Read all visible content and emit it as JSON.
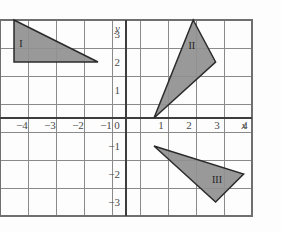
{
  "chart_data": {
    "type": "scatter",
    "title": "",
    "subtitle": "",
    "xlabel": "x",
    "ylabel": "y",
    "xlim": [
      -4.5,
      4.5
    ],
    "ylim": [
      -3.5,
      3.5
    ],
    "grid": true,
    "grid_step": 1,
    "legend": "none",
    "x_ticks": [
      -4,
      -3,
      -2,
      -1,
      0,
      1,
      2,
      3,
      4
    ],
    "x_tick_labels": [
      "−4",
      "−3",
      "−2",
      "−1",
      "0",
      "1",
      "2",
      "3",
      "4"
    ],
    "y_ticks": [
      3,
      2,
      1,
      0,
      -1,
      -2,
      -3
    ],
    "y_tick_labels": [
      "3",
      "2",
      "1",
      "0",
      "−1",
      "−2",
      "−3"
    ],
    "shapes": [
      {
        "name": "triangle-I",
        "label": "I",
        "label_xy": [
          -3.75,
          2.6
        ],
        "vertices": [
          [
            -4,
            3.5
          ],
          [
            -1,
            2
          ],
          [
            -4,
            2
          ]
        ],
        "fill": "#909090",
        "stroke": "#2b2b2b"
      },
      {
        "name": "triangle-II",
        "label": "II",
        "label_xy": [
          2.35,
          2.55
        ],
        "vertices": [
          [
            2.4,
            3.5
          ],
          [
            3.2,
            2
          ],
          [
            1,
            0
          ]
        ],
        "fill": "#909090",
        "stroke": "#2b2b2b"
      },
      {
        "name": "triangle-III",
        "label": "III",
        "label_xy": [
          3.25,
          -2.25
        ],
        "vertices": [
          [
            1,
            -1
          ],
          [
            4.2,
            -2
          ],
          [
            3.2,
            -3
          ]
        ],
        "fill": "#909090",
        "stroke": "#2b2b2b"
      }
    ],
    "axis_color": "#3d3d3d",
    "grid_color": "#8a8a8a",
    "background": "#fdfdfd"
  },
  "axes": {
    "x_axis_label": "x",
    "y_axis_label": "y"
  }
}
